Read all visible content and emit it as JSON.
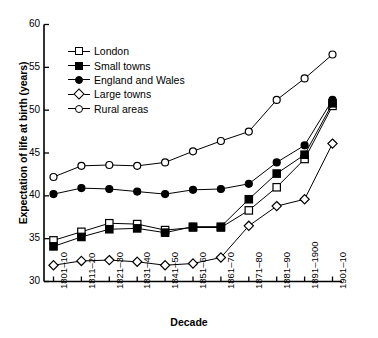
{
  "chart_data": {
    "type": "line",
    "title": "",
    "xlabel": "Decade",
    "ylabel": "Expectation of life at birth (years)",
    "categories": [
      "1801–10",
      "1811–20",
      "1821–30",
      "1831–40",
      "1841–50",
      "1851–60",
      "1861–70",
      "1871–80",
      "1881–90",
      "1891–1900",
      "1901–10"
    ],
    "ylim": [
      30,
      60
    ],
    "yticks": [
      30,
      35,
      40,
      45,
      50,
      55,
      60
    ],
    "grid": false,
    "legend_position": "upper-left-inside",
    "series": [
      {
        "name": "London",
        "marker": "open-square",
        "values": [
          34.8,
          35.8,
          36.8,
          36.7,
          36.0,
          36.3,
          36.3,
          38.3,
          41.0,
          44.3,
          50.5
        ]
      },
      {
        "name": "Small towns",
        "marker": "filled-square",
        "values": [
          34.1,
          35.2,
          36.1,
          36.2,
          35.7,
          36.4,
          36.4,
          39.6,
          42.6,
          44.8,
          50.8
        ]
      },
      {
        "name": "England and Wales",
        "marker": "filled-circle",
        "values": [
          40.2,
          40.9,
          40.8,
          40.5,
          40.2,
          40.7,
          40.8,
          41.4,
          43.9,
          45.9,
          51.2
        ]
      },
      {
        "name": "Large towns",
        "marker": "open-diamond",
        "values": [
          31.9,
          32.4,
          32.5,
          32.3,
          31.9,
          32.1,
          32.8,
          36.5,
          38.8,
          39.6,
          46.1
        ]
      },
      {
        "name": "Rural areas",
        "marker": "open-circle",
        "values": [
          42.2,
          43.5,
          43.6,
          43.5,
          43.9,
          45.2,
          46.4,
          47.5,
          51.2,
          53.7,
          56.5
        ]
      }
    ]
  },
  "axes": {
    "ylabel": "Expectation of life at birth (years)",
    "xlabel": "Decade",
    "ytick_labels": [
      "60",
      "55",
      "50",
      "45",
      "40",
      "35",
      "30"
    ],
    "xtick_labels": [
      "1801–10",
      "1811–20",
      "1821–30",
      "1831–40",
      "1841–50",
      "1851–60",
      "1861–70",
      "1871–80",
      "1881–90",
      "1891–1900",
      "1901–10"
    ]
  },
  "legend": {
    "items": [
      {
        "label": "London",
        "marker": "open-square"
      },
      {
        "label": "Small towns",
        "marker": "filled-square"
      },
      {
        "label": "England and Wales",
        "marker": "filled-circle"
      },
      {
        "label": "Large towns",
        "marker": "open-diamond"
      },
      {
        "label": "Rural areas",
        "marker": "open-circle"
      }
    ]
  },
  "colors": {
    "axis": "#000000",
    "line": "#000000",
    "marker_fill_open": "#ffffff",
    "marker_fill_closed": "#000000",
    "background": "#ffffff"
  }
}
